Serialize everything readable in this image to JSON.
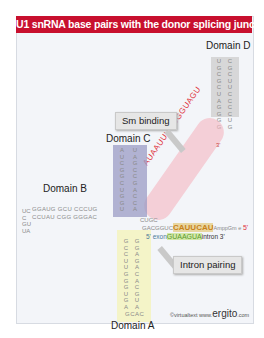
{
  "title": "U1 snRNA base pairs with the donor splicing junction",
  "domains": {
    "a": "Domain A",
    "b": "Domain B",
    "c": "Domain C",
    "d": "Domain D"
  },
  "callouts": {
    "sm_binding": "Sm binding",
    "intron_pairing": "Intron pairing"
  },
  "sequences": {
    "sm_site": "AUAAUUUGUGGUAGU",
    "sm_site_end": "3'",
    "u1_5prime_region": "CAUUCAU",
    "u1_5prime_prefix": "GACGGUC",
    "u1_5prime_cap": "AmppGm e",
    "u1_5prime_label": "5'",
    "junction_top": "CUGC",
    "exon_label": "5' exon",
    "intron_pairing_seq": "GUAAGUA",
    "intron_label": "intron 3'",
    "domain_b_top": "GGAUG GCU CCCUG",
    "domain_b_bottom": "CCUAU CGG GGGAC",
    "domain_b_loop": "UCC GUUA",
    "domain_c_left": "AUCGGCUGGU",
    "domain_c_right": "UAGCCGACCA",
    "domain_d_left": "UGCGCUAGGGG",
    "domain_d_right": "CGCUUCCCCUG",
    "domain_a_left": "GCCUUGGGUGA",
    "domain_a_right": "GGAGACACGUA",
    "domain_a_loop": "GCAC"
  },
  "credit": {
    "prefix": "©virtualtext www.",
    "brand": "ergito",
    "suffix": ".com"
  },
  "colors": {
    "title_bg": "#c8102e",
    "domain_c": "#9b9bc4",
    "domain_d": "#cfcfcf",
    "domain_a": "#f4f4c8",
    "sm_site_highlight": "#f5b5c0",
    "sm_site_text": "#e0303a",
    "pairing_highlight_u1": "#e8d6a0",
    "pairing_text_u1": "#c8821a",
    "pairing_highlight_intron": "#d3e8a8",
    "pairing_text_intron": "#5a9a2a"
  }
}
